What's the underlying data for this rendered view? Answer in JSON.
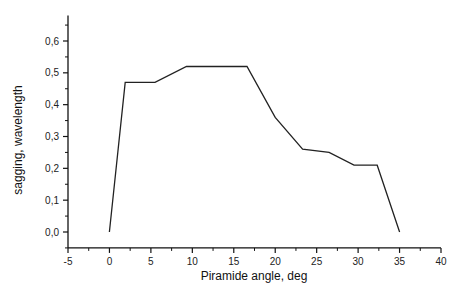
{
  "chart_data": {
    "type": "line",
    "title": "",
    "xlabel": "Piramide angle, deg",
    "ylabel": "sagging, wavelength",
    "xlim": [
      -5,
      40
    ],
    "ylim": [
      -0.05,
      0.68
    ],
    "x_ticks": [
      -5,
      0,
      5,
      10,
      15,
      20,
      25,
      30,
      35,
      40
    ],
    "x_tick_labels": [
      "-5",
      "0",
      "5",
      "10",
      "15",
      "20",
      "25",
      "30",
      "35",
      "40"
    ],
    "y_ticks": [
      0.0,
      0.1,
      0.2,
      0.3,
      0.4,
      0.5,
      0.6
    ],
    "y_tick_labels": [
      "0,0",
      "0,1",
      "0,2",
      "0,3",
      "0,4",
      "0,5",
      "0,6"
    ],
    "grid": false,
    "legend": null,
    "series": [
      {
        "name": "sagging",
        "color": "#222222",
        "x": [
          0,
          1.9,
          5.5,
          9.3,
          16.6,
          20.0,
          23.3,
          26.5,
          29.5,
          32.3,
          35.0
        ],
        "y": [
          0.0,
          0.47,
          0.47,
          0.52,
          0.52,
          0.36,
          0.26,
          0.25,
          0.21,
          0.21,
          0.0
        ]
      }
    ]
  }
}
